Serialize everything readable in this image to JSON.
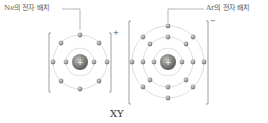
{
  "labels": {
    "left": "Ne의 전자 배치",
    "right": "Ar의 전자 배치"
  },
  "ions": [
    {
      "name": "X",
      "charge": "+",
      "shells": [
        2,
        8
      ],
      "nucleus_symbol": "+"
    },
    {
      "name": "Y",
      "charge": "−",
      "shells": [
        2,
        8,
        8
      ],
      "nucleus_symbol": "+"
    }
  ],
  "caption": "XY",
  "colors": {
    "electron": "#8a8a8a",
    "nucleus": "#6e6e6e",
    "shell": "#cfcfcf",
    "bracket": "#777777"
  }
}
